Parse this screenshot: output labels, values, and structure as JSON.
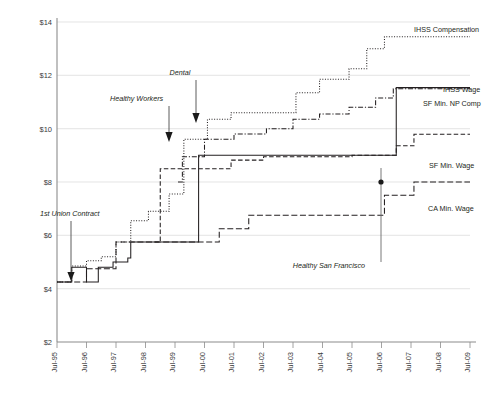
{
  "chart_data": {
    "type": "line",
    "title": "",
    "xlabel": "",
    "ylabel": "",
    "ylim": [
      2,
      14
    ],
    "ytick_labels": [
      "$2",
      "$4",
      "$6",
      "$8",
      "$10",
      "$12",
      "$14"
    ],
    "ytick_values": [
      2,
      4,
      6,
      8,
      10,
      12,
      14
    ],
    "grid": true,
    "legend_position": "right-inline",
    "x": [
      "Jul-95",
      "Jul-96",
      "Jul-97",
      "Jul-98",
      "Jul-99",
      "Jul-00",
      "Jul-01",
      "Jul-02",
      "Jul-03",
      "Jul-04",
      "Jul-05",
      "Jul-06",
      "Jul-07",
      "Jul-08",
      "Jul-09"
    ],
    "xlim": [
      "Jul-95",
      "Jul-09"
    ],
    "series": [
      {
        "name": "IHSS Compensation",
        "style": "dotted",
        "points": [
          [
            1995.5,
            4.25
          ],
          [
            1996.0,
            4.25
          ],
          [
            1996.0,
            4.85
          ],
          [
            1996.5,
            4.85
          ],
          [
            1996.5,
            5.05
          ],
          [
            1997.0,
            5.05
          ],
          [
            1997.0,
            5.2
          ],
          [
            1997.5,
            5.2
          ],
          [
            1997.5,
            5.75
          ],
          [
            1998.0,
            5.75
          ],
          [
            1998.0,
            6.55
          ],
          [
            1998.6,
            6.55
          ],
          [
            1998.6,
            6.9
          ],
          [
            1999.3,
            6.9
          ],
          [
            1999.3,
            7.55
          ],
          [
            1999.8,
            7.55
          ],
          [
            1999.8,
            9.6
          ],
          [
            2000.6,
            9.6
          ],
          [
            2000.6,
            10.35
          ],
          [
            2001.4,
            10.35
          ],
          [
            2001.4,
            10.6
          ],
          [
            2003.6,
            10.6
          ],
          [
            2003.6,
            11.35
          ],
          [
            2004.4,
            11.35
          ],
          [
            2004.4,
            11.85
          ],
          [
            2005.4,
            11.85
          ],
          [
            2005.4,
            12.25
          ],
          [
            2006.0,
            12.25
          ],
          [
            2006.0,
            13.0
          ],
          [
            2006.6,
            13.0
          ],
          [
            2006.6,
            13.45
          ],
          [
            2009.5,
            13.45
          ]
        ]
      },
      {
        "name": "SF Min. NP Comp",
        "style": "dash-dot",
        "points": [
          [
            1999.6,
            8.0
          ],
          [
            1999.75,
            8.0
          ],
          [
            1999.75,
            8.95
          ],
          [
            2000.5,
            8.95
          ],
          [
            2000.5,
            9.6
          ],
          [
            2001.5,
            9.6
          ],
          [
            2001.5,
            9.8
          ],
          [
            2002.6,
            9.8
          ],
          [
            2002.6,
            10.0
          ],
          [
            2003.5,
            10.0
          ],
          [
            2003.5,
            10.35
          ],
          [
            2004.4,
            10.35
          ],
          [
            2004.4,
            10.55
          ],
          [
            2005.4,
            10.55
          ],
          [
            2005.4,
            10.8
          ],
          [
            2006.3,
            10.8
          ],
          [
            2006.3,
            11.15
          ],
          [
            2006.9,
            11.15
          ],
          [
            2006.9,
            11.5
          ],
          [
            2009.5,
            11.5
          ]
        ]
      },
      {
        "name": "IHSS Wage",
        "style": "solid",
        "points": [
          [
            1995.5,
            4.25
          ],
          [
            1996.0,
            4.25
          ],
          [
            1996.0,
            4.8
          ],
          [
            1996.5,
            4.8
          ],
          [
            1996.5,
            4.25
          ],
          [
            1996.9,
            4.25
          ],
          [
            1996.9,
            4.8
          ],
          [
            1997.4,
            4.8
          ],
          [
            1997.4,
            5.0
          ],
          [
            1997.9,
            5.0
          ],
          [
            1997.9,
            5.15
          ],
          [
            1998.0,
            5.15
          ],
          [
            1998.0,
            5.75
          ],
          [
            2000.3,
            5.75
          ],
          [
            2000.3,
            9.0
          ],
          [
            2007.0,
            9.0
          ],
          [
            2007.0,
            11.54
          ],
          [
            2009.5,
            11.54
          ]
        ]
      },
      {
        "name": "SF Min. Wage",
        "style": "dashed",
        "points": [
          [
            1998.8,
            5.75
          ],
          [
            1999.0,
            5.75
          ],
          [
            1999.0,
            8.5
          ],
          [
            2001.4,
            8.5
          ],
          [
            2001.4,
            8.82
          ],
          [
            2002.5,
            8.82
          ],
          [
            2002.5,
            8.95
          ],
          [
            2005.5,
            8.95
          ],
          [
            2005.5,
            9.0
          ],
          [
            2007.0,
            9.0
          ],
          [
            2007.0,
            9.36
          ],
          [
            2007.6,
            9.36
          ],
          [
            2007.6,
            9.79
          ],
          [
            2009.5,
            9.79
          ]
        ]
      },
      {
        "name": "CA Min. Wage",
        "style": "dash-dot-long",
        "points": [
          [
            1995.5,
            4.25
          ],
          [
            1996.5,
            4.25
          ],
          [
            1996.5,
            4.75
          ],
          [
            1997.5,
            4.75
          ],
          [
            1997.5,
            5.75
          ],
          [
            2001.0,
            5.75
          ],
          [
            2001.0,
            6.25
          ],
          [
            2002.0,
            6.25
          ],
          [
            2002.0,
            6.75
          ],
          [
            2006.6,
            6.75
          ],
          [
            2006.6,
            7.5
          ],
          [
            2007.6,
            7.5
          ],
          [
            2007.6,
            8.0
          ],
          [
            2009.5,
            8.0
          ]
        ]
      }
    ],
    "annotations": [
      {
        "label": "1st Union Contract",
        "style": "italic",
        "target_x": "Jul-96",
        "target_y": 4.8
      },
      {
        "label": "Healthy Workers",
        "style": "italic",
        "target_x": "Jul-00",
        "target_y": 9.6
      },
      {
        "label": "Dental",
        "style": "italic",
        "target_x": "Jul-00",
        "target_y": 10.35
      },
      {
        "label": "Healthy San Francisco",
        "style": "italic",
        "target_x": "Jul-07",
        "target_y": 9.0
      }
    ],
    "series_labels": [
      {
        "text": "IHSS Compensation"
      },
      {
        "text": "IHSS Wage"
      },
      {
        "text": "SF Min. NP Comp"
      },
      {
        "text": "SF Min. Wage"
      },
      {
        "text": "CA Min. Wage"
      }
    ]
  }
}
